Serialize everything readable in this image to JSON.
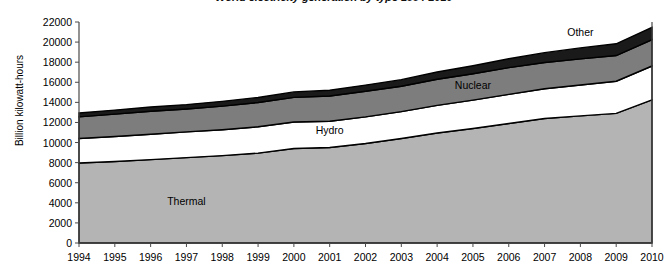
{
  "chart_data": {
    "type": "area",
    "stacked": true,
    "title": "World electricity generation by type 1994-2010",
    "xlabel": "",
    "ylabel": "Billion kilowatt-hours",
    "ylim": [
      0,
      22000
    ],
    "ytick_step": 2000,
    "yticks": [
      "22000",
      "20000",
      "18000",
      "16000",
      "14000",
      "12000",
      "10000",
      "8000",
      "6000",
      "4000",
      "2000",
      "0"
    ],
    "grid": false,
    "legend_position": "inline-annotations",
    "x": [
      "1994",
      "1995",
      "1996",
      "1997",
      "1998",
      "1999",
      "2000",
      "2001",
      "2002",
      "2003",
      "2004",
      "2005",
      "2006",
      "2007",
      "2008",
      "2009",
      "2010"
    ],
    "series": [
      {
        "name": "Thermal",
        "color": "#b4b4b4",
        "values": [
          7960,
          8120,
          8300,
          8500,
          8700,
          8950,
          9400,
          9500,
          9900,
          10400,
          10950,
          11400,
          11900,
          12400,
          12650,
          12900,
          14250
        ]
      },
      {
        "name": "Hydro",
        "color": "#ffffff",
        "values": [
          2450,
          2480,
          2520,
          2560,
          2580,
          2620,
          2650,
          2620,
          2650,
          2680,
          2750,
          2820,
          2900,
          2960,
          3080,
          3200,
          3370
        ]
      },
      {
        "name": "Nuclear",
        "color": "#7d7d7d",
        "values": [
          2150,
          2230,
          2300,
          2280,
          2350,
          2420,
          2450,
          2520,
          2560,
          2520,
          2600,
          2630,
          2660,
          2610,
          2600,
          2560,
          2620
        ]
      },
      {
        "name": "Other",
        "color": "#1a1a1a",
        "values": [
          380,
          400,
          420,
          440,
          470,
          500,
          540,
          570,
          610,
          660,
          720,
          790,
          880,
          980,
          1090,
          1170,
          1230
        ]
      }
    ],
    "annotations": [
      {
        "label": "Thermal",
        "x": "1997",
        "y": 4200
      },
      {
        "label": "Hydro",
        "x": "2001",
        "y": 11200
      },
      {
        "label": "Nuclear",
        "x": "2005",
        "y": 15700
      },
      {
        "label": "Other",
        "x": "2008",
        "y": 21000
      }
    ]
  }
}
